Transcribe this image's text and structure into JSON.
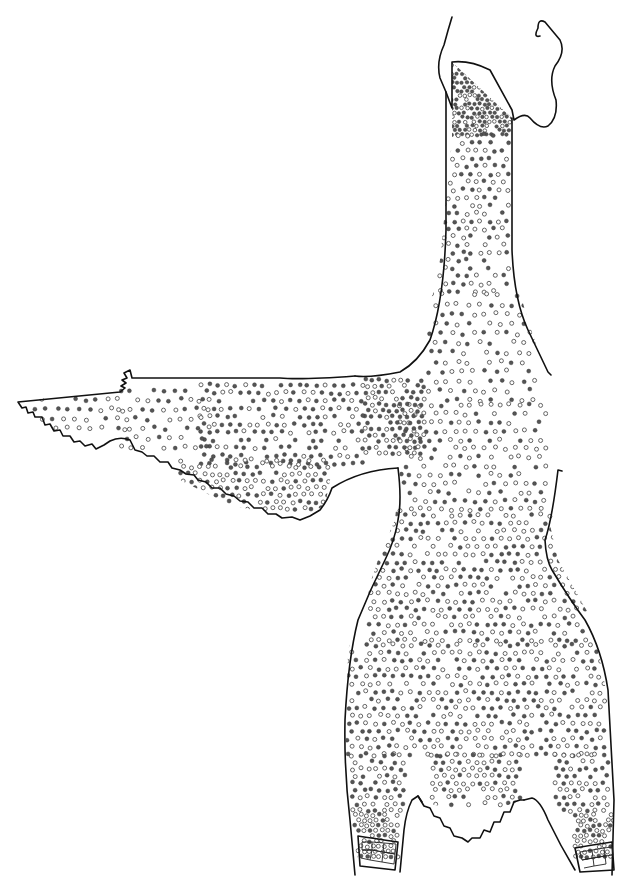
{
  "figure": {
    "type": "pterylosis-diagram",
    "background": "#ffffff",
    "ink_color": "#111111",
    "dot_filled_color": "#555555",
    "dot_open_color": "#ffffff",
    "legend": {
      "filled_dot": "feather follicle (dark)",
      "open_dot": "feather follicle (light)"
    },
    "parts": [
      {
        "id": "head-skin",
        "label": "head skin flap"
      },
      {
        "id": "neck",
        "label": "neck"
      },
      {
        "id": "body",
        "label": "body / ventral tract"
      },
      {
        "id": "wing",
        "label": "left wing (spread)"
      },
      {
        "id": "left-leg",
        "label": "left leg"
      },
      {
        "id": "right-leg",
        "label": "right leg"
      },
      {
        "id": "tail",
        "label": "tail / vent region"
      },
      {
        "id": "left-foot-scales",
        "label": "left tarsus scales"
      },
      {
        "id": "right-foot-scales",
        "label": "right tarsus scales"
      }
    ],
    "dot_regions": [
      {
        "id": "throat-dense",
        "x": 452,
        "y": 65,
        "w": 62,
        "h": 70,
        "spacing": 5,
        "filled_ratio": 0.75
      },
      {
        "id": "neck",
        "x": 440,
        "y": 135,
        "w": 72,
        "h": 160,
        "spacing": 9,
        "filled_ratio": 0.45
      },
      {
        "id": "upper-breast",
        "x": 430,
        "y": 295,
        "w": 110,
        "h": 110,
        "spacing": 11,
        "filled_ratio": 0.4
      },
      {
        "id": "breast",
        "x": 400,
        "y": 405,
        "w": 150,
        "h": 110,
        "spacing": 10,
        "filled_ratio": 0.35
      },
      {
        "id": "belly",
        "x": 370,
        "y": 515,
        "w": 220,
        "h": 130,
        "spacing": 9,
        "filled_ratio": 0.4
      },
      {
        "id": "lower-belly",
        "x": 348,
        "y": 645,
        "w": 260,
        "h": 110,
        "spacing": 9,
        "filled_ratio": 0.45
      },
      {
        "id": "vent",
        "x": 432,
        "y": 755,
        "w": 90,
        "h": 50,
        "spacing": 8,
        "filled_ratio": 0.4
      },
      {
        "id": "left-leg",
        "x": 352,
        "y": 755,
        "w": 55,
        "h": 60,
        "spacing": 8,
        "filled_ratio": 0.45
      },
      {
        "id": "right-leg",
        "x": 555,
        "y": 755,
        "w": 55,
        "h": 60,
        "spacing": 8,
        "filled_ratio": 0.45
      },
      {
        "id": "left-shin",
        "x": 355,
        "y": 815,
        "w": 45,
        "h": 45,
        "spacing": 6,
        "filled_ratio": 0.25
      },
      {
        "id": "right-shin",
        "x": 575,
        "y": 815,
        "w": 40,
        "h": 45,
        "spacing": 6,
        "filled_ratio": 0.25
      },
      {
        "id": "wing-shoulder",
        "x": 365,
        "y": 380,
        "w": 60,
        "h": 75,
        "spacing": 7,
        "filled_ratio": 0.6
      },
      {
        "id": "wing-coverts",
        "x": 200,
        "y": 385,
        "w": 165,
        "h": 80,
        "spacing": 9,
        "filled_ratio": 0.7
      },
      {
        "id": "wing-mid",
        "x": 120,
        "y": 390,
        "w": 90,
        "h": 60,
        "spacing": 11,
        "filled_ratio": 0.55
      },
      {
        "id": "wing-tip",
        "x": 30,
        "y": 400,
        "w": 95,
        "h": 35,
        "spacing": 11,
        "filled_ratio": 0.5
      },
      {
        "id": "wing-lower",
        "x": 180,
        "y": 460,
        "w": 150,
        "h": 55,
        "spacing": 8,
        "filled_ratio": 0.35
      }
    ]
  }
}
